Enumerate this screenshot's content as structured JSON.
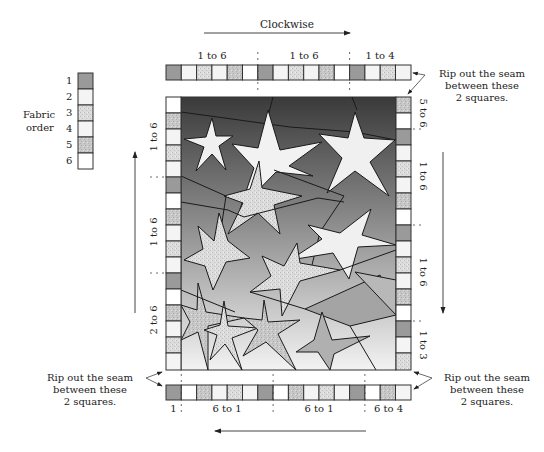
{
  "title": "Clockwise",
  "fabric_legend": {
    "label_line1": "Fabric",
    "label_line2": "order",
    "items": [
      {
        "num": "1",
        "pattern": "dark"
      },
      {
        "num": "2",
        "pattern": "white"
      },
      {
        "num": "3",
        "pattern": "speckle"
      },
      {
        "num": "4",
        "pattern": "white"
      },
      {
        "num": "5",
        "pattern": "speckle-dark"
      },
      {
        "num": "6",
        "pattern": "white"
      }
    ]
  },
  "colors": {
    "dark": "#9a9a9a",
    "white": "#f4f4f4",
    "speckle": "#d8d8d8",
    "speckle_dark": "#c4c4c4",
    "border": "#333333",
    "sky_top": "#3c3c3c",
    "sky_bottom": "#f2f2f2",
    "star": "#f0f0f0"
  },
  "top_strip": {
    "segments": [
      "1 to 6",
      "1 to 6",
      "1 to 4"
    ],
    "squares": [
      1,
      2,
      3,
      4,
      5,
      6,
      1,
      2,
      3,
      4,
      5,
      6,
      1,
      2,
      3,
      4
    ]
  },
  "bottom_strip": {
    "segments": [
      "1",
      "6 to 1",
      "6 to 1",
      "6 to 4"
    ],
    "squares": [
      1,
      6,
      5,
      4,
      3,
      2,
      1,
      6,
      5,
      4,
      3,
      2,
      1,
      6,
      5,
      4
    ]
  },
  "left_strip": {
    "segments": [
      "1 to 6",
      "1 to 6",
      "2 to 6"
    ],
    "squares_top_to_bottom": [
      6,
      5,
      4,
      3,
      2,
      1,
      6,
      5,
      4,
      3,
      2,
      1,
      6,
      5,
      4,
      3,
      2
    ]
  },
  "right_strip": {
    "segments": [
      "5 to 6",
      "1 to 6",
      "1 to 6",
      "1 to 3"
    ],
    "squares_top_to_bottom": [
      5,
      6,
      1,
      2,
      3,
      4,
      5,
      6,
      1,
      2,
      3,
      4,
      5,
      6,
      1,
      2,
      3
    ]
  },
  "annotations": {
    "top_right": [
      "Rip out the seam",
      "between these",
      "2 squares."
    ],
    "bottom_left": [
      "Rip out the seam",
      "between these",
      "2 squares."
    ],
    "bottom_right": [
      "Rip out the seam",
      "between these",
      "2 squares."
    ]
  }
}
